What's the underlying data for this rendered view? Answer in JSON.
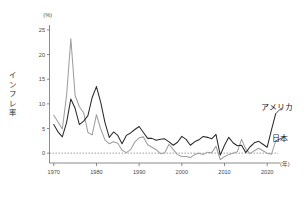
{
  "chart_data": {
    "type": "line",
    "title": "",
    "xlabel": "(年)",
    "ylabel": "インフレ率",
    "yunit": "(%)",
    "xlim": [
      1969,
      2023
    ],
    "ylim": [
      -2,
      26
    ],
    "yticks": [
      0,
      5,
      10,
      15,
      20,
      25
    ],
    "ytick_labels": [
      "0",
      "5",
      "10",
      "15",
      "20",
      "25"
    ],
    "xticks": [
      1970,
      1980,
      1990,
      2000,
      2010,
      2020
    ],
    "xtick_labels": [
      "1970",
      "1980",
      "1990",
      "2000",
      "2010",
      "2020"
    ],
    "grid": false,
    "zero_line": 0,
    "legend_position": "inline-right",
    "x": [
      1970,
      1971,
      1972,
      1973,
      1974,
      1975,
      1976,
      1977,
      1978,
      1979,
      1980,
      1981,
      1982,
      1983,
      1984,
      1985,
      1986,
      1987,
      1988,
      1989,
      1990,
      1991,
      1992,
      1993,
      1994,
      1995,
      1996,
      1997,
      1998,
      1999,
      2000,
      2001,
      2002,
      2003,
      2004,
      2005,
      2006,
      2007,
      2008,
      2009,
      2010,
      2011,
      2012,
      2013,
      2014,
      2015,
      2016,
      2017,
      2018,
      2019,
      2020,
      2021,
      2022
    ],
    "series": [
      {
        "name": "アメリカ",
        "color": "#2b2b2b",
        "values": [
          5.8,
          4.3,
          3.3,
          6.2,
          11.0,
          9.1,
          5.8,
          6.5,
          7.6,
          11.3,
          13.5,
          10.3,
          6.2,
          3.2,
          4.3,
          3.6,
          1.9,
          3.6,
          4.1,
          4.8,
          5.4,
          4.2,
          3.0,
          3.0,
          2.6,
          2.8,
          2.9,
          2.3,
          1.6,
          2.2,
          3.4,
          2.8,
          1.6,
          2.3,
          2.7,
          3.4,
          3.2,
          2.9,
          3.8,
          -0.4,
          1.6,
          3.2,
          2.1,
          1.5,
          1.6,
          0.1,
          1.3,
          2.1,
          2.4,
          1.8,
          1.2,
          4.7,
          8.0
        ]
      },
      {
        "name": "日本",
        "color": "#9e9e9e",
        "values": [
          7.7,
          6.3,
          4.9,
          11.7,
          23.2,
          11.7,
          9.4,
          8.2,
          4.2,
          3.7,
          7.8,
          4.9,
          2.7,
          1.9,
          2.3,
          2.0,
          0.6,
          0.1,
          0.7,
          2.3,
          3.1,
          3.3,
          1.7,
          1.2,
          0.7,
          -0.1,
          0.1,
          1.8,
          0.7,
          -0.3,
          -0.7,
          -0.7,
          -0.9,
          -0.3,
          0.0,
          -0.3,
          0.2,
          0.1,
          1.4,
          -1.3,
          -0.7,
          -0.3,
          0.0,
          0.3,
          2.8,
          0.8,
          -0.1,
          0.5,
          1.0,
          0.5,
          0.0,
          -0.2,
          2.5
        ]
      }
    ]
  },
  "labels": {
    "us": "アメリカ",
    "jp": "日本",
    "y_axis": "インフレ率",
    "y_unit": "(%)",
    "x_unit": "(年)"
  },
  "yaxis_chars": [
    "イ",
    "ン",
    "フ",
    "レ",
    "率"
  ]
}
